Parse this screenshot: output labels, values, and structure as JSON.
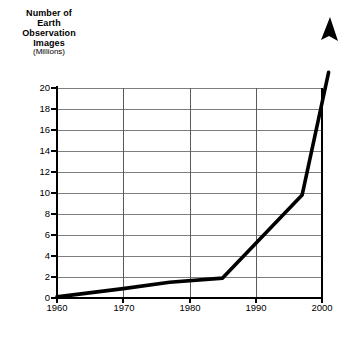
{
  "chart_data": {
    "type": "line",
    "title": "",
    "ylabel": "Number of Earth Observation Images (Millions)",
    "ylabel_lines": [
      "Number of",
      "Earth",
      "Observation",
      "Images"
    ],
    "ylabel_unit": "(Millions)",
    "xlabel": "Time",
    "xlabel_unit": "(Decades)",
    "xlabel_full": "Time (Decades)",
    "x": [
      1960,
      1970,
      1977,
      1985,
      1997,
      2001
    ],
    "values": [
      0.1,
      0.9,
      1.5,
      1.9,
      9.8,
      21.5
    ],
    "series": [
      {
        "name": "Earth Observation Images",
        "points": [
          {
            "x": 1960,
            "y": 0.1
          },
          {
            "x": 1970,
            "y": 0.9
          },
          {
            "x": 1977,
            "y": 1.5
          },
          {
            "x": 1985,
            "y": 1.9
          },
          {
            "x": 1997,
            "y": 9.8
          },
          {
            "x": 2001,
            "y": 21.5
          }
        ]
      }
    ],
    "xlim": [
      1960,
      2000
    ],
    "ylim": [
      0,
      20
    ],
    "xticks": [
      1960,
      1970,
      1980,
      1990,
      2000
    ],
    "yticks": [
      0,
      2,
      4,
      6,
      8,
      10,
      12,
      14,
      16,
      18,
      20
    ],
    "xtick_labels": [
      "1960",
      "1970",
      "1980",
      "1990",
      "2000"
    ],
    "ytick_labels": [
      "0",
      "2",
      "4",
      "6",
      "8",
      "10",
      "12",
      "14",
      "16",
      "18",
      "20"
    ],
    "grid": {
      "horizontal": true,
      "vertical": true
    },
    "legend": null,
    "annotations": [
      {
        "type": "arrowhead",
        "note": "line ends with upward arrow extending above plot area"
      }
    ],
    "colors": {
      "line": "#000000",
      "grid": "#808080",
      "axis": "#000000",
      "background": "#ffffff",
      "text": "#000000"
    }
  }
}
